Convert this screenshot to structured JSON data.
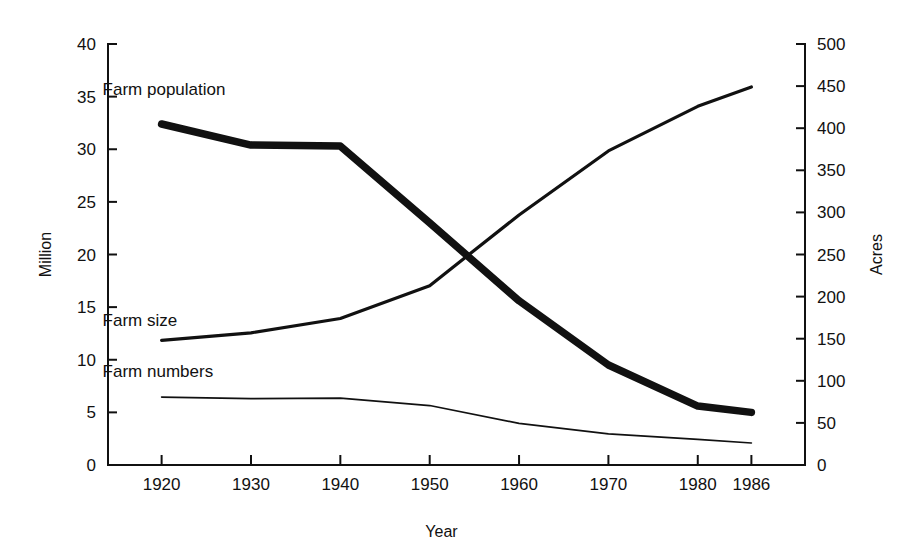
{
  "chart_data": {
    "type": "line",
    "title": "",
    "subtitle": "",
    "xlabel": "Year",
    "ylabel": "Million",
    "y2label": "Acres",
    "grid": false,
    "legend_position": "inline-labels",
    "x": [
      1920,
      1930,
      1940,
      1950,
      1960,
      1970,
      1980,
      1986
    ],
    "xtick_labels": [
      "1920",
      "1930",
      "1940",
      "1950",
      "1960",
      "1970",
      "1980",
      "1986"
    ],
    "xlim": [
      1914,
      1992
    ],
    "ylim": [
      0,
      40
    ],
    "ytick_labels": [
      "0",
      "5",
      "10",
      "15",
      "20",
      "25",
      "30",
      "35",
      "40"
    ],
    "ytick_values": [
      0,
      5,
      10,
      15,
      20,
      25,
      30,
      35,
      40
    ],
    "y2lim": [
      0,
      500
    ],
    "y2tick_labels": [
      "0",
      "50",
      "100",
      "150",
      "200",
      "250",
      "300",
      "350",
      "400",
      "450",
      "500"
    ],
    "y2tick_values": [
      0,
      50,
      100,
      150,
      200,
      250,
      300,
      350,
      400,
      450,
      500
    ],
    "series": [
      {
        "name": "Farm population",
        "label": "Farm population",
        "axis": "left",
        "units": "Million",
        "stroke_weight": "thick",
        "values": [
          32.4,
          30.4,
          30.3,
          23.0,
          15.6,
          9.5,
          5.6,
          5.0
        ]
      },
      {
        "name": "Farm size",
        "label": "Farm size",
        "axis": "right",
        "units": "Acres",
        "stroke_weight": "medium",
        "values": [
          148,
          157,
          174,
          213,
          297,
          373,
          426,
          449
        ]
      },
      {
        "name": "Farm numbers",
        "label": "Farm numbers",
        "axis": "left",
        "units": "Million",
        "stroke_weight": "thin",
        "values": [
          6.45,
          6.3,
          6.35,
          5.65,
          3.96,
          2.95,
          2.44,
          2.09
        ]
      }
    ],
    "annotations": [
      {
        "text": "Farm population",
        "x": 1920,
        "y": 35.2
      },
      {
        "text": "Farm size",
        "x": 1920,
        "y": 13.2
      },
      {
        "text": "Farm numbers",
        "x": 1920,
        "y": 8.4
      }
    ]
  },
  "axes": {
    "y_left_title": "Million",
    "y_right_title": "Acres",
    "x_title": "Year"
  }
}
